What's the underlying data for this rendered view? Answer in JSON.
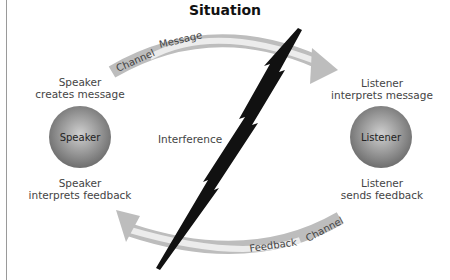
{
  "title": "Situation",
  "speaker": {
    "node_label": "Speaker",
    "top_caption": [
      "Speaker",
      "creates message"
    ],
    "bottom_caption": [
      "Speaker",
      "interprets feedback"
    ]
  },
  "listener": {
    "node_label": "Listener",
    "top_caption": [
      "Listener",
      "interprets message"
    ],
    "bottom_caption": [
      "Listener",
      "sends feedback"
    ]
  },
  "message_arrow": {
    "channel_label": "Channel",
    "content_label": "Message",
    "direction": "speaker-to-listener"
  },
  "feedback_arrow": {
    "channel_label": "Channel",
    "content_label": "Feedback",
    "direction": "listener-to-speaker"
  },
  "interference": {
    "label": "Interference",
    "icon": "lightning-bolt-icon"
  },
  "colors": {
    "node_fill": "#8a8a8a",
    "node_highlight": "#c8c8c8",
    "channel_band": "#bdbdbd",
    "content_band": "#ececec",
    "bolt": "#111111"
  }
}
